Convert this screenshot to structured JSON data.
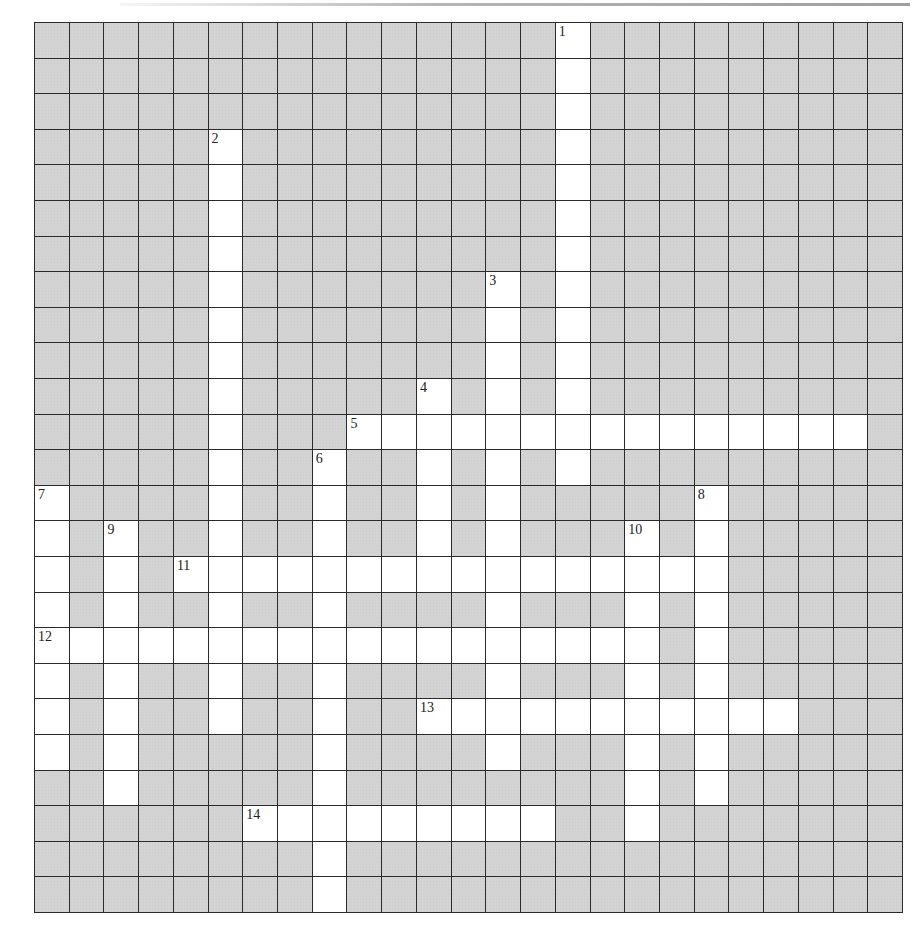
{
  "puzzle": {
    "rows": 25,
    "cols": 25,
    "colors": {
      "block": "#d3d3d3",
      "open": "#ffffff",
      "line": "#2a2a2a"
    },
    "entries": [
      {
        "number": "1",
        "direction": "down",
        "row": 0,
        "col": 15,
        "length": 13
      },
      {
        "number": "2",
        "direction": "down",
        "row": 3,
        "col": 5,
        "length": 17
      },
      {
        "number": "3",
        "direction": "down",
        "row": 7,
        "col": 13,
        "length": 14
      },
      {
        "number": "4",
        "direction": "down",
        "row": 10,
        "col": 11,
        "length": 6
      },
      {
        "number": "5",
        "direction": "across",
        "row": 11,
        "col": 9,
        "length": 15
      },
      {
        "number": "6",
        "direction": "down",
        "row": 12,
        "col": 8,
        "length": 13
      },
      {
        "number": "7",
        "direction": "down",
        "row": 13,
        "col": 0,
        "length": 8
      },
      {
        "number": "8",
        "direction": "down",
        "row": 13,
        "col": 19,
        "length": 9
      },
      {
        "number": "9",
        "direction": "down",
        "row": 14,
        "col": 2,
        "length": 8
      },
      {
        "number": "10",
        "direction": "down",
        "row": 14,
        "col": 17,
        "length": 9
      },
      {
        "number": "11",
        "direction": "across",
        "row": 15,
        "col": 4,
        "length": 16
      },
      {
        "number": "12",
        "direction": "across",
        "row": 17,
        "col": 0,
        "length": 18
      },
      {
        "number": "13",
        "direction": "across",
        "row": 19,
        "col": 11,
        "length": 11
      },
      {
        "number": "14",
        "direction": "across",
        "row": 22,
        "col": 6,
        "length": 9
      }
    ]
  }
}
